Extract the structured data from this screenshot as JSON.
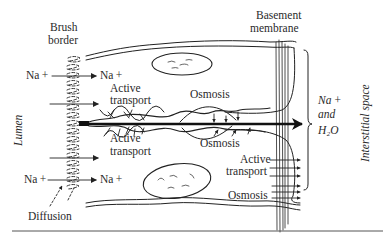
{
  "diagram": {
    "labels": {
      "brush_border_line1": "Brush",
      "brush_border_line2": "border",
      "basement_line1": "Basement",
      "basement_line2": "membrane",
      "lumen": "Lumen",
      "interstitial": "Interstitial space",
      "na_left_top": "Na +",
      "na_right_top": "Na +",
      "na_left_bottom": "Na +",
      "na_right_bottom": "Na +",
      "active_transport_top_1": "Active",
      "active_transport_top_2": "transport",
      "active_transport_mid_1": "Active",
      "active_transport_mid_2": "transport",
      "osmosis_top": "Osmosis",
      "osmosis_mid": "Osmosis",
      "active_transport_right_1": "Active",
      "active_transport_right_2": "transport",
      "osmosis_right": "Osmosis",
      "diffusion": "Diffusion",
      "product_line1": "Na +",
      "product_line2": "and",
      "product_line3": "H₂O"
    },
    "colors": {
      "ink": "#222222",
      "background": "#ffffff"
    }
  }
}
